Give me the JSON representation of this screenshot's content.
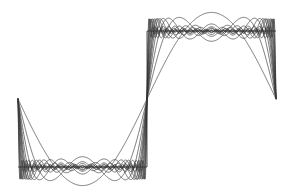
{
  "figure": {
    "title": "",
    "background_color": "#ffffff",
    "width": 293,
    "height": 196
  },
  "chart_data": {
    "type": "line",
    "title": "",
    "subtitle": "",
    "xlabel": "",
    "ylabel": "",
    "grid": false,
    "legend_position": "none",
    "axes_visible": false,
    "tick_labels_x": [],
    "tick_labels_y": [],
    "xlim": [
      -1.0,
      1.0
    ],
    "ylim": [
      -1.35,
      1.35
    ],
    "line_color": "#3a3a3a",
    "square_wave_color": "#2b2b2b",
    "series": [
      {
        "name": "square wave (target)",
        "kind": "square",
        "amplitude": 1.0,
        "period": 2.0,
        "values_description": "-1 for x in [-1,0), +1 for x in [0,1]"
      },
      {
        "name": "N = 1",
        "kind": "fourier_partial_sum",
        "harmonics": [
          1
        ],
        "coefficients": [
          1.2732
        ]
      },
      {
        "name": "N = 3",
        "kind": "fourier_partial_sum",
        "harmonics": [
          1,
          3
        ],
        "coefficients": [
          1.2732,
          0.4244
        ]
      },
      {
        "name": "N = 5",
        "kind": "fourier_partial_sum",
        "harmonics": [
          1,
          3,
          5
        ],
        "coefficients": [
          1.2732,
          0.4244,
          0.2546
        ]
      },
      {
        "name": "N = 7",
        "kind": "fourier_partial_sum",
        "harmonics": [
          1,
          3,
          5,
          7
        ],
        "coefficients": [
          1.2732,
          0.4244,
          0.2546,
          0.1819
        ]
      },
      {
        "name": "N = 9",
        "kind": "fourier_partial_sum",
        "harmonics": [
          1,
          3,
          5,
          7,
          9
        ],
        "coefficients": [
          1.2732,
          0.4244,
          0.2546,
          0.1819,
          0.1415
        ]
      },
      {
        "name": "N = 11",
        "kind": "fourier_partial_sum",
        "harmonics": [
          1,
          3,
          5,
          7,
          9,
          11
        ],
        "coefficients": [
          1.2732,
          0.4244,
          0.2546,
          0.1819,
          0.1415,
          0.1157
        ]
      },
      {
        "name": "N = 13",
        "kind": "fourier_partial_sum",
        "harmonics": [
          1,
          3,
          5,
          7,
          9,
          11,
          13
        ],
        "coefficients": [
          1.2732,
          0.4244,
          0.2546,
          0.1819,
          0.1415,
          0.1157,
          0.0979
        ]
      },
      {
        "name": "N = 17",
        "kind": "fourier_partial_sum",
        "harmonics": [
          1,
          3,
          5,
          7,
          9,
          11,
          13,
          15,
          17
        ],
        "coefficients": [
          1.2732,
          0.4244,
          0.2546,
          0.1819,
          0.1415,
          0.1157,
          0.0979,
          0.0849,
          0.0749
        ]
      },
      {
        "name": "N = 23",
        "kind": "fourier_partial_sum",
        "harmonics": [
          1,
          3,
          5,
          7,
          9,
          11,
          13,
          15,
          17,
          19,
          21,
          23
        ],
        "coefficients": [
          1.2732,
          0.4244,
          0.2546,
          0.1819,
          0.1415,
          0.1157,
          0.0979,
          0.0849,
          0.0749,
          0.067,
          0.0606,
          0.0554
        ]
      },
      {
        "name": "N = 31",
        "kind": "fourier_partial_sum",
        "harmonics": [
          1,
          3,
          5,
          7,
          9,
          11,
          13,
          15,
          17,
          19,
          21,
          23,
          25,
          27,
          29,
          31
        ],
        "coefficients": [
          1.2732,
          0.4244,
          0.2546,
          0.1819,
          0.1415,
          0.1157,
          0.0979,
          0.0849,
          0.0749,
          0.067,
          0.0606,
          0.0554,
          0.0509,
          0.0472,
          0.0439,
          0.0411
        ]
      },
      {
        "name": "N = 45",
        "kind": "fourier_partial_sum",
        "harmonics": [
          1,
          3,
          5,
          7,
          9,
          11,
          13,
          15,
          17,
          19,
          21,
          23,
          25,
          27,
          29,
          31,
          33,
          35,
          37,
          39,
          41,
          43,
          45
        ],
        "coefficients": [
          1.2732,
          0.4244,
          0.2546,
          0.1819,
          0.1415,
          0.1157,
          0.0979,
          0.0849,
          0.0749,
          0.067,
          0.0606,
          0.0554,
          0.0509,
          0.0472,
          0.0439,
          0.0411,
          0.0386,
          0.0364,
          0.0344,
          0.0327,
          0.0311,
          0.0296,
          0.0283
        ]
      },
      {
        "name": "N = 65",
        "kind": "fourier_partial_sum",
        "harmonics": [
          1,
          3,
          5,
          7,
          9,
          11,
          13,
          15,
          17,
          19,
          21,
          23,
          25,
          27,
          29,
          31,
          33,
          35,
          37,
          39,
          41,
          43,
          45,
          47,
          49,
          51,
          53,
          55,
          57,
          59,
          61,
          63,
          65
        ],
        "coefficients": [
          1.2732,
          0.4244,
          0.2546,
          0.1819,
          0.1415,
          0.1157,
          0.0979,
          0.0849,
          0.0749,
          0.067,
          0.0606,
          0.0554,
          0.0509,
          0.0472,
          0.0439,
          0.0411,
          0.0386,
          0.0364,
          0.0344,
          0.0327,
          0.0311,
          0.0296,
          0.0283,
          0.0271,
          0.026,
          0.025,
          0.024,
          0.0231,
          0.0223,
          0.0216,
          0.0209,
          0.0202,
          0.0196
        ]
      }
    ],
    "gibbs": {
      "overshoot_ratio": 1.17898,
      "note": "peak overshoot approximately 8.95 percent above the target amplitude"
    },
    "geometry_px": {
      "x_left": 18,
      "x_center": 147,
      "x_right": 276,
      "y_low": 167,
      "y_high": 31,
      "y_mid": 99
    }
  }
}
